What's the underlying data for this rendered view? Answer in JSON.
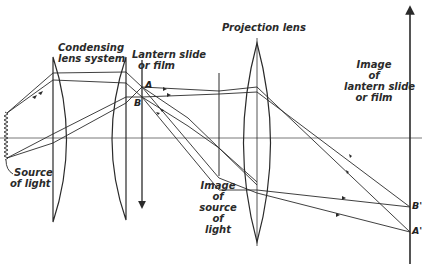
{
  "diagram": {
    "type": "optical-ray-diagram",
    "labels": {
      "condensing": [
        "Condensing",
        "lens system"
      ],
      "lantern_slide": [
        "Lantern  slide",
        "or film"
      ],
      "projection_lens": "Projection lens",
      "image_of_slide": [
        "Image",
        "of",
        "lantern slide",
        "or film"
      ],
      "image_of_source": [
        "Image",
        "of",
        "source",
        "of",
        "light"
      ],
      "source": [
        "Source",
        "of light"
      ]
    },
    "points": {
      "A": "A",
      "B": "B",
      "A_prime": "A'",
      "B_prime": "B'"
    },
    "caption": "",
    "colors": {
      "ink": "#2a2a2a",
      "background": "#ffffff",
      "axis": "#555555"
    }
  }
}
